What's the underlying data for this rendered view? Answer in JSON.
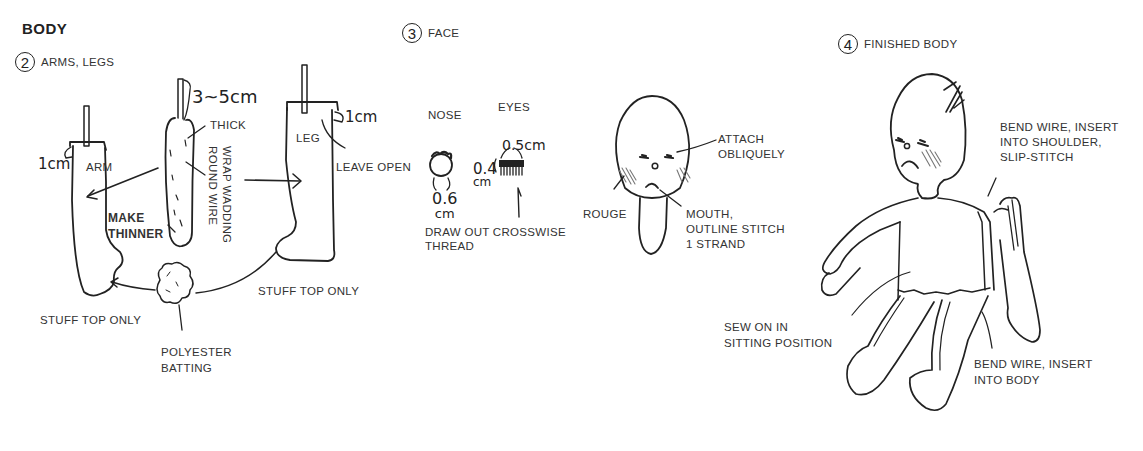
{
  "title": "BODY",
  "steps": [
    {
      "number": "2",
      "label": "ARMS, LEGS",
      "annotations": {
        "wire_length": "3~5cm",
        "thick": "THICK",
        "wrap": [
          "WRAP WADDING",
          "ROUND WIRE"
        ],
        "arm": "ARM",
        "arm_margin": "1cm",
        "make_thinner": [
          "MAKE",
          "THINNER"
        ],
        "leg": "LEG",
        "leg_margin": "1cm",
        "leave_open": "LEAVE OPEN",
        "stuff_top_left": "STUFF TOP ONLY",
        "stuff_top_right": "STUFF TOP ONLY",
        "batting": [
          "POLYESTER",
          "BATTING"
        ]
      }
    },
    {
      "number": "3",
      "label": "FACE",
      "annotations": {
        "nose": "NOSE",
        "eyes": "EYES",
        "nose_size": [
          "0.6",
          "cm"
        ],
        "eye_width": "0.5cm",
        "eye_height": [
          "0.4",
          "cm"
        ],
        "draw_out": [
          "DRAW OUT CROSSWISE",
          "THREAD"
        ],
        "attach": [
          "ATTACH",
          "OBLIQUELY"
        ],
        "rouge": "ROUGE",
        "mouth": [
          "MOUTH,",
          "OUTLINE STITCH",
          "1 STRAND"
        ]
      }
    },
    {
      "number": "4",
      "label": "FINISHED BODY",
      "annotations": {
        "shoulder": [
          "BEND WIRE, INSERT",
          "INTO SHOULDER,",
          "SLIP-STITCH"
        ],
        "sitting": [
          "SEW ON IN",
          "SITTING POSITION"
        ],
        "body": [
          "BEND WIRE, INSERT",
          "INTO BODY"
        ]
      }
    }
  ],
  "colors": {
    "ink": "#222222",
    "background": "#ffffff",
    "hatch": "#888888"
  }
}
